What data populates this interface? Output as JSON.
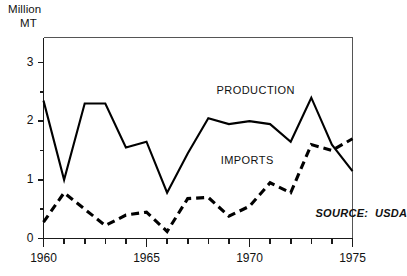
{
  "chart_data": {
    "type": "line",
    "title": "",
    "subtitle": "",
    "ylabel_line1": "Million",
    "ylabel_line2": "MT",
    "xlabel": "",
    "ylabel": "Million MT",
    "grid": false,
    "legend_position": "inline-annotation",
    "xlim": [
      1960,
      1975
    ],
    "ylim": [
      0,
      3
    ],
    "y_ticks": [
      0,
      1,
      2,
      3
    ],
    "y_tick_labels": [
      "0",
      "1",
      "2",
      "3"
    ],
    "y_minor_ticks": [
      0.5,
      1.5,
      2.5
    ],
    "x_ticks": [
      1960,
      1961,
      1962,
      1963,
      1964,
      1965,
      1966,
      1967,
      1968,
      1969,
      1970,
      1971,
      1972,
      1973,
      1974,
      1975
    ],
    "x_tick_labels": [
      "1960",
      "",
      "",
      "",
      "",
      "1965",
      "",
      "",
      "",
      "",
      "1970",
      "",
      "",
      "",
      "",
      "1975"
    ],
    "x_major_ticks": [
      1960,
      1965,
      1970,
      1975
    ],
    "x": [
      1960,
      1961,
      1962,
      1963,
      1964,
      1965,
      1966,
      1967,
      1968,
      1969,
      1970,
      1971,
      1972,
      1973,
      1974,
      1975
    ],
    "series": [
      {
        "name": "PRODUCTION",
        "style": "solid",
        "color": "#000000",
        "values": [
          2.35,
          1.0,
          2.3,
          2.3,
          1.55,
          1.65,
          0.78,
          1.45,
          2.05,
          1.95,
          2.0,
          1.95,
          1.65,
          2.4,
          1.6,
          1.15
        ]
      },
      {
        "name": "IMPORTS",
        "style": "dashed",
        "color": "#000000",
        "values": [
          0.28,
          0.78,
          0.5,
          0.22,
          0.4,
          0.45,
          0.12,
          0.68,
          0.7,
          0.38,
          0.55,
          0.95,
          0.78,
          1.6,
          1.5,
          1.7
        ]
      }
    ],
    "annotations": [
      {
        "id": "production-label",
        "text": "PRODUCTION",
        "x": 1968.4,
        "y": 2.52
      },
      {
        "id": "imports-label",
        "text": "IMPORTS",
        "x": 1968.6,
        "y": 1.32
      },
      {
        "id": "source-note",
        "text": "SOURCE:  USDA",
        "x": 1973.2,
        "y": 0.42
      }
    ],
    "source": "SOURCE:  USDA"
  },
  "axes": {
    "unit_label_line1": "Million",
    "unit_label_line2": "MT"
  },
  "series_labels": {
    "production": "PRODUCTION",
    "imports": "IMPORTS"
  },
  "footer": {
    "source": "SOURCE:  USDA"
  },
  "colors": {
    "ink": "#000000",
    "frame": "#555555",
    "background": "#ffffff"
  }
}
